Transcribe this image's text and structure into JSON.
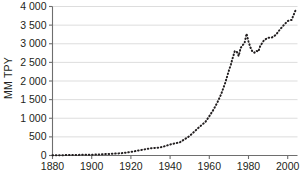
{
  "chart_data": {
    "type": "line",
    "title": "",
    "subtitle": "",
    "xlabel": "",
    "ylabel": "MM TPY",
    "xlim": [
      1880,
      2005
    ],
    "ylim": [
      0,
      4000
    ],
    "grid": true,
    "legend": null,
    "line_style": "dotted",
    "line_color": "#231f20",
    "grid_color": "#d9d9d9",
    "axis_color": "#6e6e6e",
    "background": "#ffffff",
    "xticks": [
      1880,
      1900,
      1920,
      1940,
      1960,
      1980,
      2000
    ],
    "xtick_labels": [
      "1880",
      "1900",
      "1920",
      "1940",
      "1960",
      "1980",
      "2000"
    ],
    "yticks": [
      0,
      500,
      1000,
      1500,
      2000,
      2500,
      3000,
      3500,
      4000
    ],
    "ytick_labels": [
      "0",
      "500",
      "1 000",
      "1 500",
      "2 000",
      "2 500",
      "3 000",
      "3 500",
      "4 000"
    ],
    "x": [
      1880,
      1885,
      1890,
      1895,
      1900,
      1905,
      1910,
      1915,
      1920,
      1925,
      1930,
      1935,
      1940,
      1945,
      1950,
      1955,
      1958,
      1960,
      1962,
      1964,
      1966,
      1968,
      1970,
      1971,
      1972,
      1973,
      1974,
      1975,
      1976,
      1977,
      1978,
      1979,
      1980,
      1981,
      1982,
      1983,
      1984,
      1985,
      1986,
      1987,
      1988,
      1990,
      1992,
      1994,
      1996,
      1998,
      2000,
      2002,
      2004
    ],
    "values": [
      5,
      8,
      14,
      18,
      22,
      32,
      45,
      60,
      95,
      145,
      195,
      215,
      295,
      355,
      525,
      770,
      900,
      1055,
      1220,
      1410,
      1640,
      1930,
      2280,
      2440,
      2630,
      2800,
      2790,
      2670,
      2890,
      2960,
      3020,
      3270,
      3060,
      2900,
      2790,
      2760,
      2810,
      2790,
      2940,
      3020,
      3100,
      3160,
      3170,
      3240,
      3380,
      3500,
      3610,
      3640,
      3900
    ],
    "units": "MM TPY",
    "n_points": 49,
    "annotations": [
      {
        "label": "peak",
        "x": 1979,
        "y": 3270
      },
      {
        "label": "trough",
        "x": 1983,
        "y": 2760
      },
      {
        "label": "end",
        "x": 2004,
        "y": 3900
      }
    ]
  }
}
